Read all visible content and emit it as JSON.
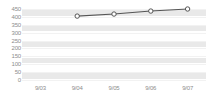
{
  "chart_data": {
    "type": "line",
    "title": "",
    "xlabel": "",
    "ylabel": "",
    "categories": [
      "9/03",
      "9/04",
      "9/05",
      "9/06",
      "9/07"
    ],
    "series": [
      {
        "name": "series-1",
        "values": [
          null,
          405,
          418,
          437,
          450
        ]
      }
    ],
    "ylim": [
      0,
      450
    ],
    "y_ticks": [
      0,
      50,
      100,
      150,
      200,
      250,
      300,
      350,
      400,
      450
    ],
    "y_tick_labels": [
      "0",
      "50",
      "100",
      "150",
      "200",
      "250",
      "300",
      "350",
      "400",
      "450"
    ],
    "x_tick_labels": [
      "9/03",
      "9/04",
      "9/05",
      "9/06",
      "9/07"
    ],
    "grid": true,
    "legend": "none",
    "colors": {
      "line": "#555555",
      "marker_fill": "#ffffff",
      "marker_stroke": "#555555",
      "band": "#e9e9e9",
      "gridline": "#f2f2f2",
      "tick_text": "#8d8d8d",
      "background": "#ffffff"
    }
  }
}
